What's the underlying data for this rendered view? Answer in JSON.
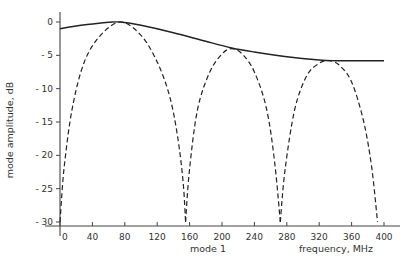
{
  "chart_data": {
    "type": "line",
    "title": "",
    "xlabel": "frequency, MHz",
    "xlabel_secondary": "mode 1",
    "ylabel": "mode amplitude, dB",
    "xlim": [
      0,
      400
    ],
    "ylim": [
      -30,
      0
    ],
    "x_ticks": [
      0,
      40,
      80,
      120,
      160,
      200,
      240,
      280,
      320,
      360,
      400
    ],
    "y_ticks": [
      0,
      -5,
      -10,
      -15,
      -20,
      -25,
      -30
    ],
    "grid": false,
    "legend": null,
    "series": [
      {
        "name": "envelope",
        "style": "solid",
        "x": [
          0,
          20,
          40,
          60,
          75,
          100,
          140,
          180,
          212,
          240,
          280,
          320,
          340,
          360,
          400
        ],
        "y": [
          -1.0,
          -0.6,
          -0.3,
          -0.05,
          0,
          -0.5,
          -1.6,
          -2.9,
          -3.9,
          -4.5,
          -5.2,
          -5.7,
          -5.8,
          -5.8,
          -5.8
        ]
      },
      {
        "name": "mode 1 (lobe 1)",
        "style": "dashed",
        "x": [
          0,
          5,
          15,
          30,
          50,
          75,
          100,
          120,
          135,
          145,
          152,
          155
        ],
        "y": [
          -30,
          -22,
          -13,
          -6,
          -2,
          0,
          -2,
          -6,
          -11,
          -17,
          -24,
          -30
        ]
      },
      {
        "name": "mode 1 (lobe 2)",
        "style": "dashed",
        "x": [
          155,
          160,
          170,
          185,
          200,
          212,
          225,
          240,
          255,
          265,
          272
        ],
        "y": [
          -30,
          -22,
          -13,
          -7.5,
          -4.8,
          -4.0,
          -4.8,
          -7.5,
          -13,
          -21,
          -30
        ]
      },
      {
        "name": "mode 1 (lobe 3)",
        "style": "dashed",
        "x": [
          272,
          278,
          290,
          305,
          320,
          332,
          345,
          360,
          375,
          385,
          392
        ],
        "y": [
          -30,
          -22,
          -13,
          -8,
          -6.2,
          -5.8,
          -6.5,
          -9,
          -15,
          -22,
          -30
        ]
      }
    ]
  }
}
